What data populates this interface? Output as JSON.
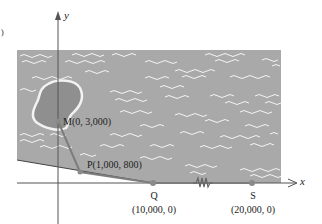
{
  "figure": {
    "axes": {
      "x_label": "x",
      "y_label": "y"
    },
    "colors": {
      "water": "#a9a9a9",
      "island": "#8f8f8f",
      "island_outline": "#f2f2f2",
      "waves": "#f4f4f4",
      "axis": "#555555",
      "land_line": "#444444",
      "path": "#7d7d7d",
      "point": "#8a8a8a"
    },
    "points": {
      "M": {
        "label": "M(0, 3,000)",
        "x": 0,
        "y": 3000
      },
      "P": {
        "label": "P(1,000, 800)",
        "x": 1000,
        "y": 800
      },
      "Q": {
        "name": "Q",
        "coords": "(10,000, 0)",
        "x": 10000,
        "y": 0
      },
      "S": {
        "name": "S",
        "coords": "(20,000, 0)",
        "x": 20000,
        "y": 0
      }
    },
    "page_marker": ")"
  }
}
